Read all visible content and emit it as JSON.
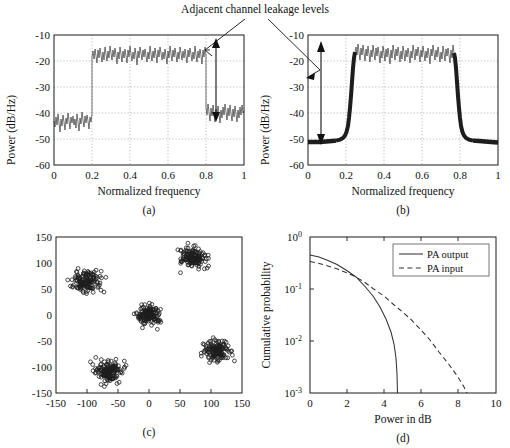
{
  "figure": {
    "annotation": "Adjacent channel leakage levels",
    "panel_labels": [
      "(a)",
      "(b)",
      "(c)",
      "(d)"
    ]
  },
  "panel_a": {
    "label": "(a)",
    "xlabel": "Normalized frequency",
    "ylabel": "Power (dB/Hz)",
    "xticks": [
      "0",
      "0.2",
      "0.4",
      "0.6",
      "0.8",
      "1"
    ],
    "yticks": [
      "-10",
      "-20",
      "-30",
      "-40",
      "-50",
      "-60"
    ],
    "arrow_top_db": -17,
    "arrow_bottom_db": -33.5,
    "arrow_x": 0.855
  },
  "panel_b": {
    "label": "(b)",
    "xlabel": "Normalized frequency",
    "ylabel": "Power (dB/Hz)",
    "xticks": [
      "0",
      "0.2",
      "0.4",
      "0.6",
      "0.8",
      "1"
    ],
    "yticks": [
      "-10",
      "-20",
      "-30",
      "-40",
      "-50",
      "-60"
    ],
    "arrow_top_db": -15,
    "arrow_bottom_db": -50,
    "arrow_x": 0.068
  },
  "panel_c": {
    "label": "(c)",
    "xticks": [
      "-150",
      "-100",
      "-50",
      "0",
      "50",
      "100",
      "150"
    ],
    "yticks": [
      "150",
      "100",
      "50",
      "0",
      "-50",
      "-100",
      "-150"
    ]
  },
  "panel_d": {
    "label": "(d)",
    "xlabel": "Power in dB",
    "ylabel": "Cumulative probability",
    "xticks": [
      "0",
      "2",
      "4",
      "6",
      "8",
      "10"
    ],
    "yticks": [
      "10",
      "10",
      "10",
      "10"
    ],
    "yexps": [
      "0",
      "-1",
      "-2",
      "-3"
    ],
    "legend": [
      {
        "label": "PA output",
        "style": "solid"
      },
      {
        "label": "PA input",
        "style": "dashed"
      }
    ]
  },
  "chart_data": [
    {
      "type": "line",
      "panel": "(a)",
      "title": "Power spectral density - nonlinear PA output (unfiltered)",
      "xlabel": "Normalized frequency",
      "ylabel": "Power (dB/Hz)",
      "xlim": [
        0,
        1
      ],
      "ylim": [
        -60,
        -10
      ],
      "xticks": [
        0,
        0.2,
        0.4,
        0.6,
        0.8,
        1
      ],
      "yticks": [
        -10,
        -20,
        -30,
        -40,
        -50,
        -60
      ],
      "grid": true,
      "series": [
        {
          "name": "PSD",
          "description": "Noisy spectrum: in-band plateau ~-17 dB/Hz between normalized frequency 0.25 and 0.75; out-of-band adjacent channel leakage floor ~-37 dB/Hz with +/-5 dB noise ripple",
          "inband_level_db": -17,
          "outofband_level_db": -37,
          "inband_start": 0.25,
          "inband_end": 0.75,
          "noise_ripple_db": 5,
          "transition_sharpness": "abrupt"
        }
      ],
      "annotations": [
        {
          "text": "Adjacent channel leakage levels",
          "arrow_from_db": -17,
          "arrow_to_db": -33.5,
          "at_x": 0.855
        }
      ]
    },
    {
      "type": "line",
      "panel": "(b)",
      "title": "Power spectral density - linearized / filtered PA output",
      "xlabel": "Normalized frequency",
      "ylabel": "Power (dB/Hz)",
      "xlim": [
        0,
        1
      ],
      "ylim": [
        -60,
        -10
      ],
      "xticks": [
        0,
        0.2,
        0.4,
        0.6,
        0.8,
        1
      ],
      "yticks": [
        -10,
        -20,
        -30,
        -40,
        -50,
        -60
      ],
      "grid": true,
      "series": [
        {
          "name": "PSD",
          "description": "In-band plateau ~-16 dB/Hz between 0.25 and 0.75; steep skirts falling to an out-of-band floor near -51 dB/Hz, i.e. about 35 dB of adjacent channel leakage suppression",
          "inband_level_db": -16,
          "outofband_level_db": -51,
          "inband_start": 0.25,
          "inband_end": 0.75,
          "noise_ripple_db": 4,
          "transition_sharpness": "steep-rolloff"
        }
      ],
      "annotations": [
        {
          "text": "Adjacent channel leakage levels",
          "arrow_from_db": -15,
          "arrow_to_db": -50,
          "at_x": 0.068
        }
      ]
    },
    {
      "type": "scatter",
      "panel": "(c)",
      "title": "Signal constellation after power amplifier",
      "xlabel": "",
      "ylabel": "",
      "xlim": [
        -150,
        150
      ],
      "ylim": [
        -150,
        150
      ],
      "xticks": [
        -150,
        -100,
        -50,
        0,
        50,
        100,
        150
      ],
      "yticks": [
        -150,
        -100,
        -50,
        0,
        50,
        100,
        150
      ],
      "grid": false,
      "marker": "open-circle",
      "clusters": [
        {
          "cx": 0,
          "cy": 0,
          "spread": 22,
          "points": 140
        },
        {
          "cx": -100,
          "cy": 65,
          "spread": 24,
          "points": 140
        },
        {
          "cx": 70,
          "cy": 110,
          "spread": 24,
          "points": 140
        },
        {
          "cx": -65,
          "cy": -110,
          "spread": 24,
          "points": 140
        },
        {
          "cx": 110,
          "cy": -70,
          "spread": 24,
          "points": 140
        }
      ]
    },
    {
      "type": "line",
      "panel": "(d)",
      "title": "Complementary cumulative distribution of instantaneous power",
      "xlabel": "Power in dB",
      "ylabel": "Cumulative probability",
      "xlim": [
        0,
        10
      ],
      "ylim": [
        0.001,
        1
      ],
      "yscale": "log",
      "xticks": [
        0,
        2,
        4,
        6,
        8,
        10
      ],
      "yticks": [
        1,
        0.1,
        0.01,
        0.001
      ],
      "grid": false,
      "legend_position": "upper-right",
      "series": [
        {
          "name": "PA output",
          "style": "solid",
          "x": [
            0,
            0.5,
            1.0,
            1.5,
            2.0,
            2.5,
            3.0,
            3.4,
            3.7,
            3.9,
            3.98,
            4.0,
            4.0
          ],
          "y": [
            0.45,
            0.42,
            0.37,
            0.3,
            0.22,
            0.145,
            0.075,
            0.033,
            0.013,
            0.005,
            0.002,
            0.0013,
            0.001
          ]
        },
        {
          "name": "PA input",
          "style": "dashed",
          "x": [
            0,
            0.5,
            1.0,
            1.5,
            2.0,
            2.5,
            3.0,
            3.5,
            4.0,
            4.5,
            5.0,
            5.5,
            6.0,
            6.5,
            7.0,
            7.5,
            8.0,
            8.3
          ],
          "y": [
            0.34,
            0.315,
            0.285,
            0.25,
            0.21,
            0.17,
            0.13,
            0.097,
            0.07,
            0.048,
            0.032,
            0.021,
            0.013,
            0.0078,
            0.0045,
            0.0026,
            0.0014,
            0.001
          ]
        }
      ]
    }
  ]
}
